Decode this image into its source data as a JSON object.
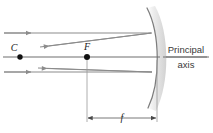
{
  "diagram": {
    "labels": {
      "center_of_curvature": "C",
      "focal_point": "F",
      "focal_length": "f",
      "axis_line1": "Principal",
      "axis_line2": "axis"
    },
    "colors": {
      "ray": "#8c8c8c",
      "axis": "#6e6e6e",
      "mirror": "#7a7a7a",
      "mirror_shadow": "#d8d8d8",
      "point": "#111111",
      "text": "#1a1a1a",
      "background": "#ffffff"
    },
    "geometry": {
      "axis_y": 57,
      "focal_point_x": 87,
      "center_x": 20,
      "mirror_vertex_x": 157,
      "upper_ray_y": 33,
      "lower_ray_y": 72,
      "dimension_y": 118
    },
    "elements": {
      "incident_ray_upper": "incident-ray-upper",
      "incident_ray_lower": "incident-ray-lower",
      "reflected_ray_upper": "reflected-ray-upper",
      "reflected_ray_lower": "reflected-ray-lower",
      "mirror": "concave-mirror",
      "principal_axis": "principal-axis",
      "focal_dimension": "focal-length-dimension"
    }
  }
}
